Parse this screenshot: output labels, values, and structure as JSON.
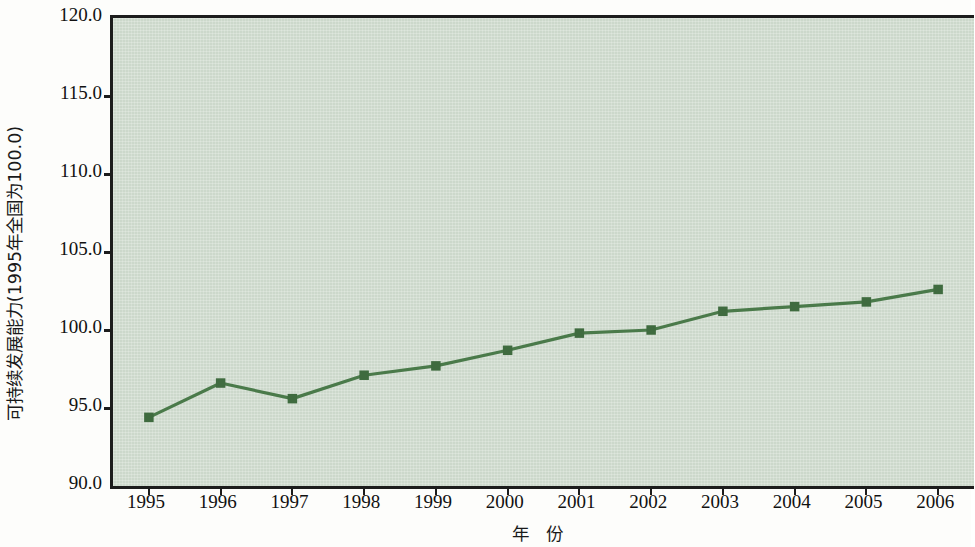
{
  "chart_data": {
    "type": "line",
    "title": "",
    "xlabel": "年 份",
    "ylabel": "可持续发展能力(1995年全国为100.0)",
    "categories": [
      "1995",
      "1996",
      "1997",
      "1998",
      "1999",
      "2000",
      "2001",
      "2002",
      "2003",
      "2004",
      "2005",
      "2006"
    ],
    "x": [
      1995,
      1996,
      1997,
      1998,
      1999,
      2000,
      2001,
      2002,
      2003,
      2004,
      2005,
      2006
    ],
    "values": [
      94.4,
      96.6,
      95.6,
      97.1,
      97.7,
      98.7,
      99.8,
      100.0,
      101.2,
      101.5,
      101.8,
      102.6
    ],
    "series": [
      {
        "name": "可持续发展能力",
        "values": [
          94.4,
          96.6,
          95.6,
          97.1,
          97.7,
          98.7,
          99.8,
          100.0,
          101.2,
          101.5,
          101.8,
          102.6
        ]
      }
    ],
    "ylim": [
      90.0,
      120.0
    ],
    "y_ticks": [
      "90.0",
      "95.0",
      "100.0",
      "105.0",
      "110.0",
      "115.0",
      "120.0"
    ],
    "y_tick_values": [
      90.0,
      95.0,
      100.0,
      105.0,
      110.0,
      115.0,
      120.0
    ],
    "x_tick_labels": [
      "1995",
      "1996",
      "1997",
      "1998",
      "1999",
      "2000",
      "2001",
      "2002",
      "2003",
      "2004",
      "2005",
      "2006"
    ],
    "grid": false,
    "legend": "none",
    "marker": "square",
    "colors": {
      "line": "#4a7a4a",
      "marker": "#3f6b3f",
      "plot_background": "#ccd8cb",
      "axis": "#1c1c1c",
      "text": "#111111",
      "page_background": "#fdfdfb"
    }
  }
}
